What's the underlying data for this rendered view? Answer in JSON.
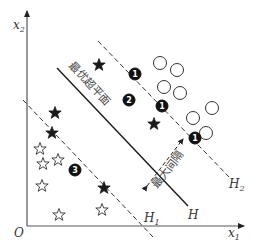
{
  "diagram": {
    "type": "svm-maximum-margin",
    "axes": {
      "origin_label": "O",
      "x_label": "x",
      "x_sub": "1",
      "y_label": "x",
      "y_sub": "2"
    },
    "lines": {
      "hyperplane_label": "H",
      "h1_label": "H",
      "h1_sub": "1",
      "h2_label": "H",
      "h2_sub": "2"
    },
    "annotations": {
      "optimal_hyperplane": "最优超平面",
      "max_margin": "最大间隔"
    },
    "points": {
      "filled_circles": [
        {
          "x": 135,
          "y": 74,
          "num": "1"
        },
        {
          "x": 129,
          "y": 100,
          "num": "2"
        },
        {
          "x": 162,
          "y": 106,
          "num": "1"
        },
        {
          "x": 195,
          "y": 138,
          "num": "1"
        },
        {
          "x": 75,
          "y": 170,
          "num": "3"
        }
      ],
      "empty_circles": [
        {
          "x": 160,
          "y": 63
        },
        {
          "x": 177,
          "y": 70
        },
        {
          "x": 164,
          "y": 87
        },
        {
          "x": 180,
          "y": 93
        },
        {
          "x": 212,
          "y": 108
        },
        {
          "x": 193,
          "y": 118
        },
        {
          "x": 206,
          "y": 133
        }
      ],
      "filled_stars": [
        {
          "x": 99,
          "y": 65
        },
        {
          "x": 55,
          "y": 113
        },
        {
          "x": 52,
          "y": 133
        },
        {
          "x": 154,
          "y": 124
        },
        {
          "x": 104,
          "y": 188
        }
      ],
      "empty_stars": [
        {
          "x": 40,
          "y": 149
        },
        {
          "x": 43,
          "y": 164
        },
        {
          "x": 58,
          "y": 160
        },
        {
          "x": 42,
          "y": 186
        },
        {
          "x": 59,
          "y": 215
        },
        {
          "x": 102,
          "y": 210
        }
      ]
    },
    "colors": {
      "ink": "#1a1a1a",
      "axis": "#333333",
      "background": "#ffffff"
    }
  }
}
